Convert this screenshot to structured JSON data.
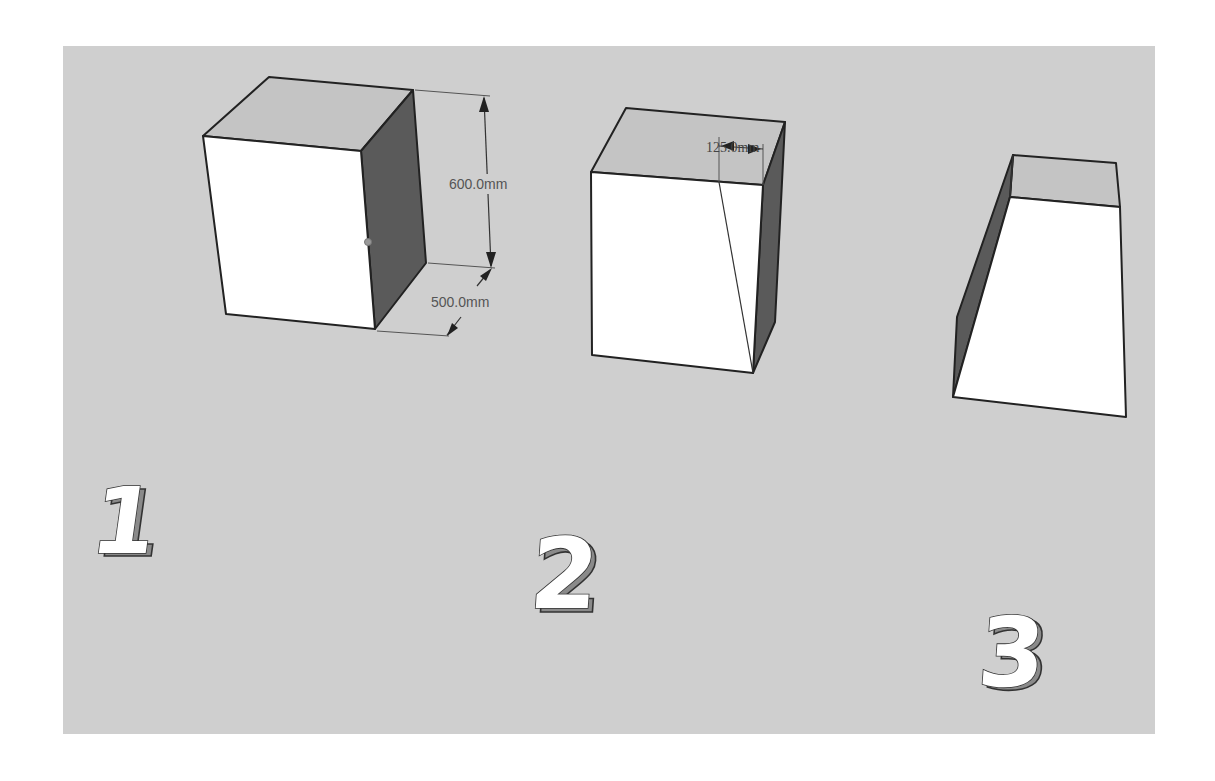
{
  "figure": {
    "background_color": "#cfcfcf",
    "page_color": "#ffffff"
  },
  "steps": [
    {
      "label": "1",
      "object": "box",
      "dimensions": [
        {
          "label": "600.0mm",
          "axis": "height"
        },
        {
          "label": "500.0mm",
          "axis": "depth"
        }
      ]
    },
    {
      "label": "2",
      "object": "box-with-diagonal-edge",
      "dimensions": [
        {
          "label": "125.0mm",
          "axis": "top-offset"
        }
      ]
    },
    {
      "label": "3",
      "object": "tapered-block",
      "dimensions": []
    }
  ]
}
